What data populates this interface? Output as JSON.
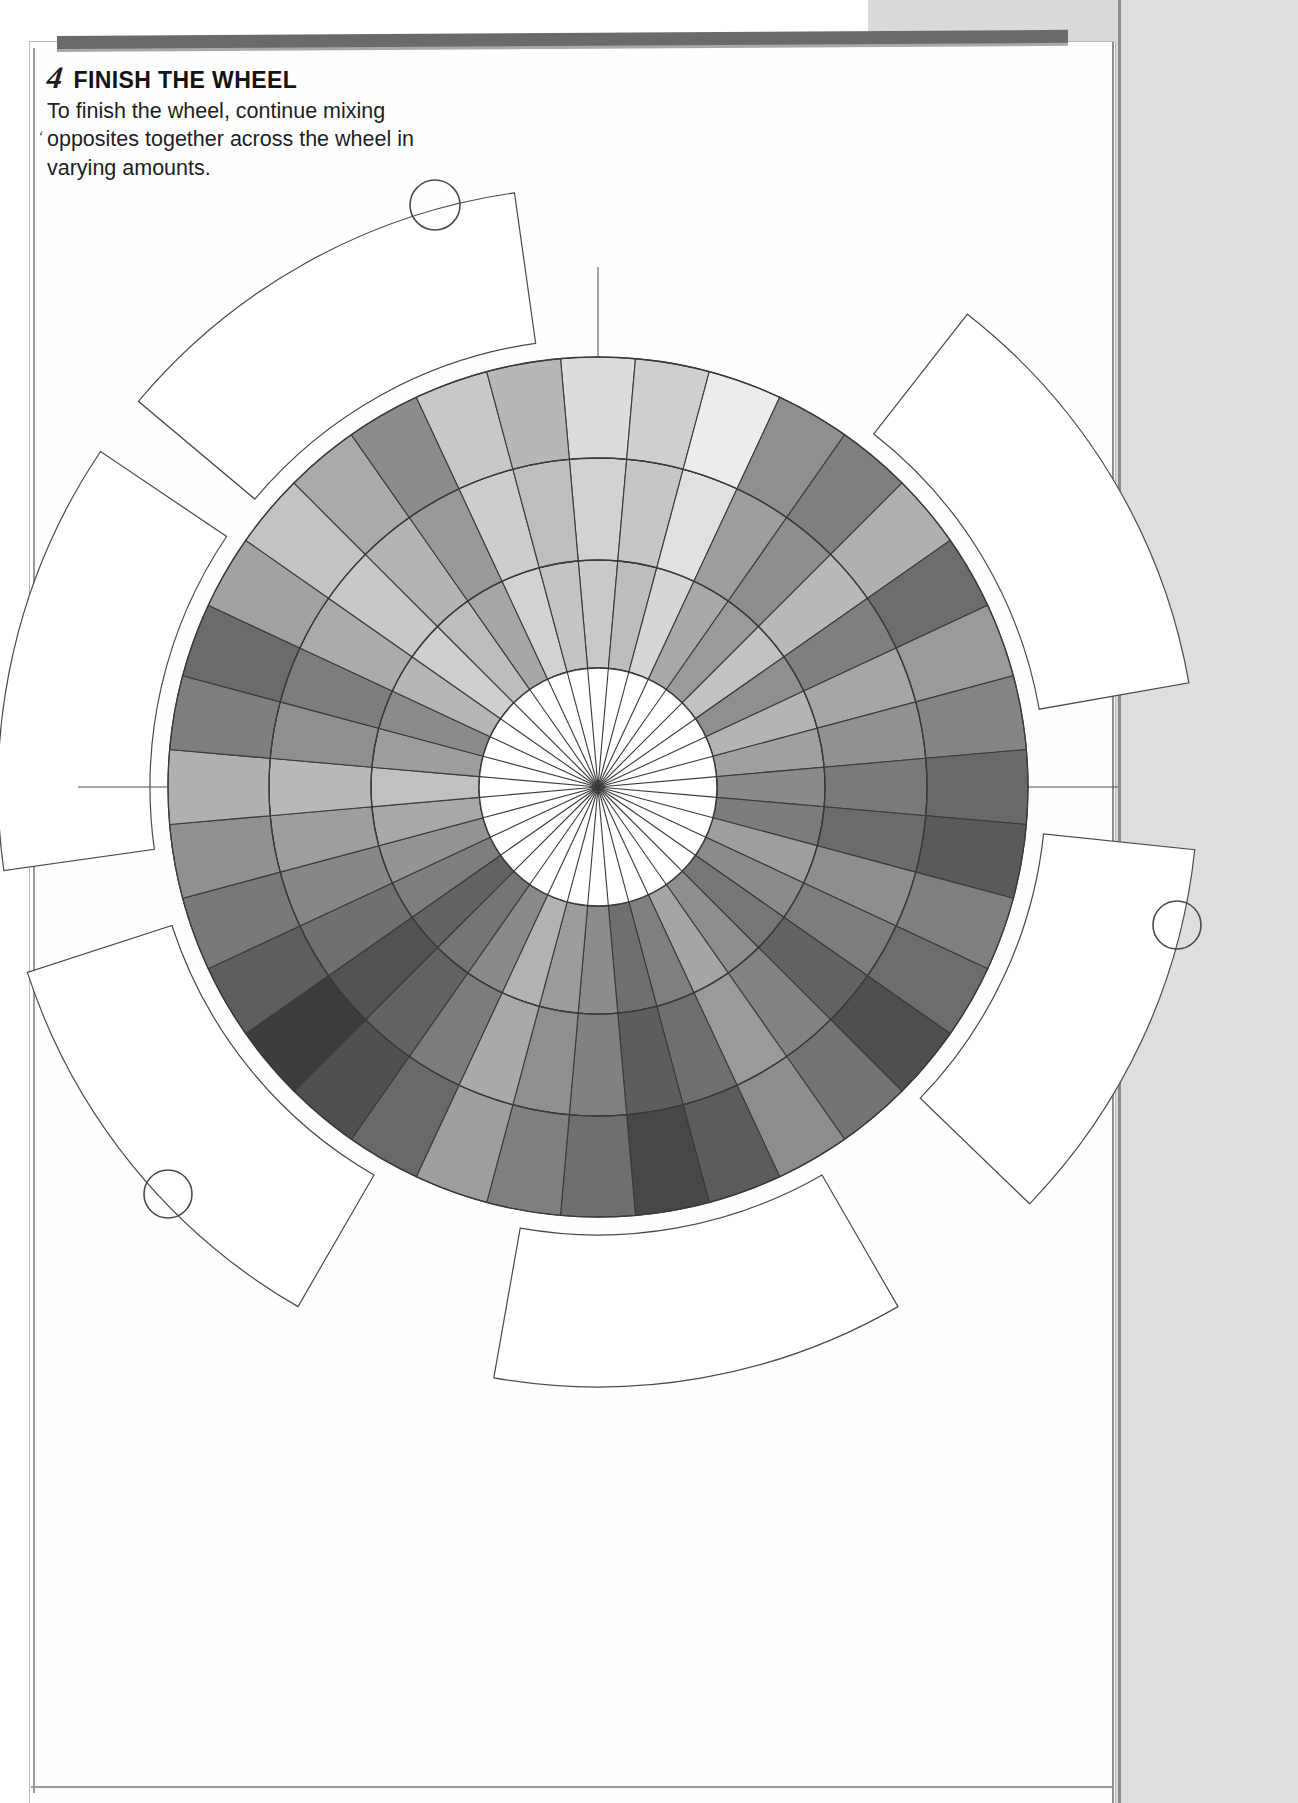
{
  "page": {
    "step_number": "4",
    "step_title": "FINISH THE WHEEL",
    "body_text": "To finish the wheel, continue mixing opposites together across the wheel in varying amounts.",
    "stray_pen_mark": "‘"
  },
  "colors": {
    "ink": "#3a3a3a",
    "paper": "#fefefe",
    "backdrop": "#d9d9d9",
    "top_bar": "#6a6a6a"
  },
  "chart_data": {
    "type": "pie",
    "subtype": "polar-grid / colour-wheel",
    "center": {
      "x": 598,
      "y": 787
    },
    "segments": 36,
    "rings": 4,
    "ring_radii": [
      119,
      227,
      329,
      430
    ],
    "inner_hole_radius": 119,
    "rotation_offset_deg": -95,
    "grid": true,
    "legend": "none",
    "ring_labels": [
      "ring-1-inner-white",
      "ring-2",
      "ring-3",
      "ring-4-outer"
    ],
    "series": [
      {
        "name": "ring-2",
        "values": [
          "#c9c9c9",
          "#bdbdbd",
          "#d6d6d6",
          "#a8a8a8",
          "#9a9a9a",
          "#c2c2c2",
          "#8f8f8f",
          "#b4b4b4",
          "#a0a0a0",
          "#8a8a8a",
          "#7c7c7c",
          "#9e9e9e",
          "#8b8b8b",
          "#767676",
          "#8e8e8e",
          "#a5a5a5",
          "#7f7f7f",
          "#6f6f6f",
          "#8c8c8c",
          "#9c9c9c",
          "#b2b2b2",
          "#8a8a8a",
          "#747474",
          "#636363",
          "#7e7e7e",
          "#949494",
          "#a8a8a8",
          "#c0c0c0",
          "#9d9d9d",
          "#8b8b8b",
          "#b6b6b6",
          "#cfcfcf",
          "#bdbdbd",
          "#a6a6a6",
          "#d2d2d2",
          "#c4c4c4"
        ]
      },
      {
        "name": "ring-3",
        "values": [
          "#d2d2d2",
          "#c6c6c6",
          "#e0e0e0",
          "#9d9d9d",
          "#8e8e8e",
          "#b9b9b9",
          "#7f7f7f",
          "#a6a6a6",
          "#929292",
          "#7a7a7a",
          "#6c6c6c",
          "#8e8e8e",
          "#7d7d7d",
          "#636363",
          "#828282",
          "#9a9a9a",
          "#6f6f6f",
          "#5d5d5d",
          "#818181",
          "#8f8f8f",
          "#a9a9a9",
          "#7c7c7c",
          "#636363",
          "#525252",
          "#707070",
          "#878787",
          "#9e9e9e",
          "#b8b8b8",
          "#8f8f8f",
          "#7d7d7d",
          "#ababab",
          "#c8c8c8",
          "#b4b4b4",
          "#999999",
          "#cdcdcd",
          "#bebebe"
        ]
      },
      {
        "name": "ring-4",
        "values": [
          "#dcdcdc",
          "#cfcfcf",
          "#ececec",
          "#8f8f8f",
          "#7f7f7f",
          "#b0b0b0",
          "#6d6d6d",
          "#9a9a9a",
          "#848484",
          "#696969",
          "#5a5a5a",
          "#7f7f7f",
          "#6d6d6d",
          "#4e4e4e",
          "#737373",
          "#8d8d8d",
          "#5c5c5c",
          "#474747",
          "#6f6f6f",
          "#7f7f7f",
          "#9e9e9e",
          "#696969",
          "#4f4f4f",
          "#3d3d3d",
          "#5e5e5e",
          "#787878",
          "#919191",
          "#b0b0b0",
          "#7e7e7e",
          "#6b6b6b",
          "#a1a1a1",
          "#c3c3c3",
          "#aaaaaa",
          "#8c8c8c",
          "#c8c8c8",
          "#b7b7b7"
        ]
      }
    ],
    "tabs": [
      {
        "name": "tab-top-left",
        "start_deg": -140,
        "end_deg": -98,
        "r_inner": 448,
        "r_outer": 600
      },
      {
        "name": "tab-top-right",
        "start_deg": -52,
        "end_deg": -10,
        "r_inner": 448,
        "r_outer": 600
      },
      {
        "name": "tab-left",
        "start_deg": 172,
        "end_deg": 214,
        "r_inner": 448,
        "r_outer": 600
      },
      {
        "name": "tab-right",
        "start_deg": 6,
        "end_deg": 44,
        "r_inner": 448,
        "r_outer": 600
      },
      {
        "name": "tab-bottom-left",
        "start_deg": 120,
        "end_deg": 162,
        "r_inner": 448,
        "r_outer": 600
      },
      {
        "name": "tab-bottom-right",
        "start_deg": 60,
        "end_deg": 100,
        "r_inner": 448,
        "r_outer": 600
      }
    ],
    "punch_holes": [
      {
        "name": "punch-hole-top",
        "x": 435,
        "y": 205,
        "r": 25
      },
      {
        "name": "punch-hole-right",
        "x": 1177,
        "y": 925,
        "r": 24
      },
      {
        "name": "punch-hole-bottom-left",
        "x": 168,
        "y": 1194,
        "r": 24
      }
    ]
  }
}
